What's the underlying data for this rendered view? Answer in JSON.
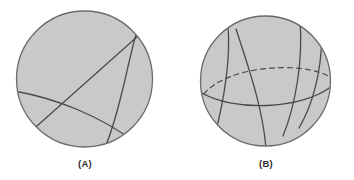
{
  "figure": {
    "type": "geometry-diagram",
    "background_color": "#ffffff",
    "panels": [
      {
        "id": "A",
        "label": "(A)",
        "disk": {
          "cx": 84.5,
          "cy": 79,
          "r": 68,
          "fill": "#c9c9c9",
          "stroke": "#6a6a6a",
          "stroke_width": 1.3
        },
        "curves": [
          {
            "name": "diagonal-chord",
            "style": "solid",
            "stroke": "#4a4a4a",
            "stroke_width": 1.3,
            "path": "M 31 131 L 144 31"
          },
          {
            "name": "right-arc",
            "style": "solid",
            "stroke": "#4a4a4a",
            "stroke_width": 1.3,
            "path": "M 137 26 C 126 62, 122 106, 108 141"
          },
          {
            "name": "lower-arc",
            "style": "solid",
            "stroke": "#4a4a4a",
            "stroke_width": 1.3,
            "path": "M 17 93 C 55 99, 100 116, 133 139"
          }
        ]
      },
      {
        "id": "B",
        "label": "(B)",
        "disk": {
          "cx": 265.5,
          "cy": 81,
          "r": 65,
          "fill": "#c9c9c9",
          "stroke": "#6a6a6a",
          "stroke_width": 1.3
        },
        "curves": [
          {
            "name": "dashed-equator-back",
            "style": "dashed",
            "dash_pattern": "5 4",
            "stroke": "#4a4a4a",
            "stroke_width": 1.2,
            "path": "M 206 95 C 228 68, 300 62, 326 76"
          },
          {
            "name": "solid-equator-front",
            "style": "solid",
            "stroke": "#4a4a4a",
            "stroke_width": 1.3,
            "path": "M 203 93 C 232 110, 300 110, 330 88"
          },
          {
            "name": "left-meridian",
            "style": "solid",
            "stroke": "#4a4a4a",
            "stroke_width": 1.3,
            "path": "M 228 28 C 230 62, 222 108, 215 136"
          },
          {
            "name": "center-meridian",
            "style": "solid",
            "stroke": "#4a4a4a",
            "stroke_width": 1.3,
            "path": "M 237 31 C 248 66, 262 108, 266 146"
          },
          {
            "name": "right-meridian",
            "style": "solid",
            "stroke": "#4a4a4a",
            "stroke_width": 1.3,
            "path": "M 299 22 C 302 60, 296 104, 284 133"
          },
          {
            "name": "far-right-meridian",
            "style": "solid",
            "stroke": "#4a4a4a",
            "stroke_width": 1.3,
            "path": "M 320 38 C 320 72, 312 104, 300 125"
          }
        ]
      }
    ]
  }
}
